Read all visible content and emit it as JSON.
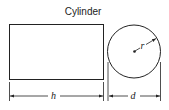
{
  "diagram": {
    "title": "Cylinder",
    "labels": {
      "height": "h",
      "diameter": "d",
      "radius": "r"
    },
    "views": [
      "side-view-rectangle",
      "end-view-circle"
    ],
    "colors": {
      "stroke": "#222222",
      "background": "#ffffff"
    }
  }
}
